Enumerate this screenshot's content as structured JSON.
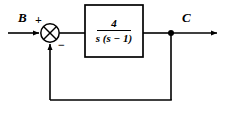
{
  "diagram": {
    "type": "control-system-block-diagram",
    "background_color": "#ffffff",
    "line_color": "#000000",
    "input": {
      "label": "B",
      "description": "input signal arrow entering summing junction"
    },
    "summing_junction": {
      "symbol": "circle-with-x-cross",
      "plus_sign": "+",
      "minus_sign": "−",
      "plus_input": "B",
      "minus_input": "feedback"
    },
    "block": {
      "name": "transfer-function-block",
      "numerator": "4",
      "denominator": "s (s − 1)",
      "transfer_function": "4 / (s(s − 1))"
    },
    "output": {
      "label": "C",
      "description": "output signal arrow leaving takeoff point"
    },
    "feedback": {
      "takeoff_point": "output-junction-dot",
      "path": "unity feedback from output to summing junction negative input",
      "gain": "1"
    }
  }
}
